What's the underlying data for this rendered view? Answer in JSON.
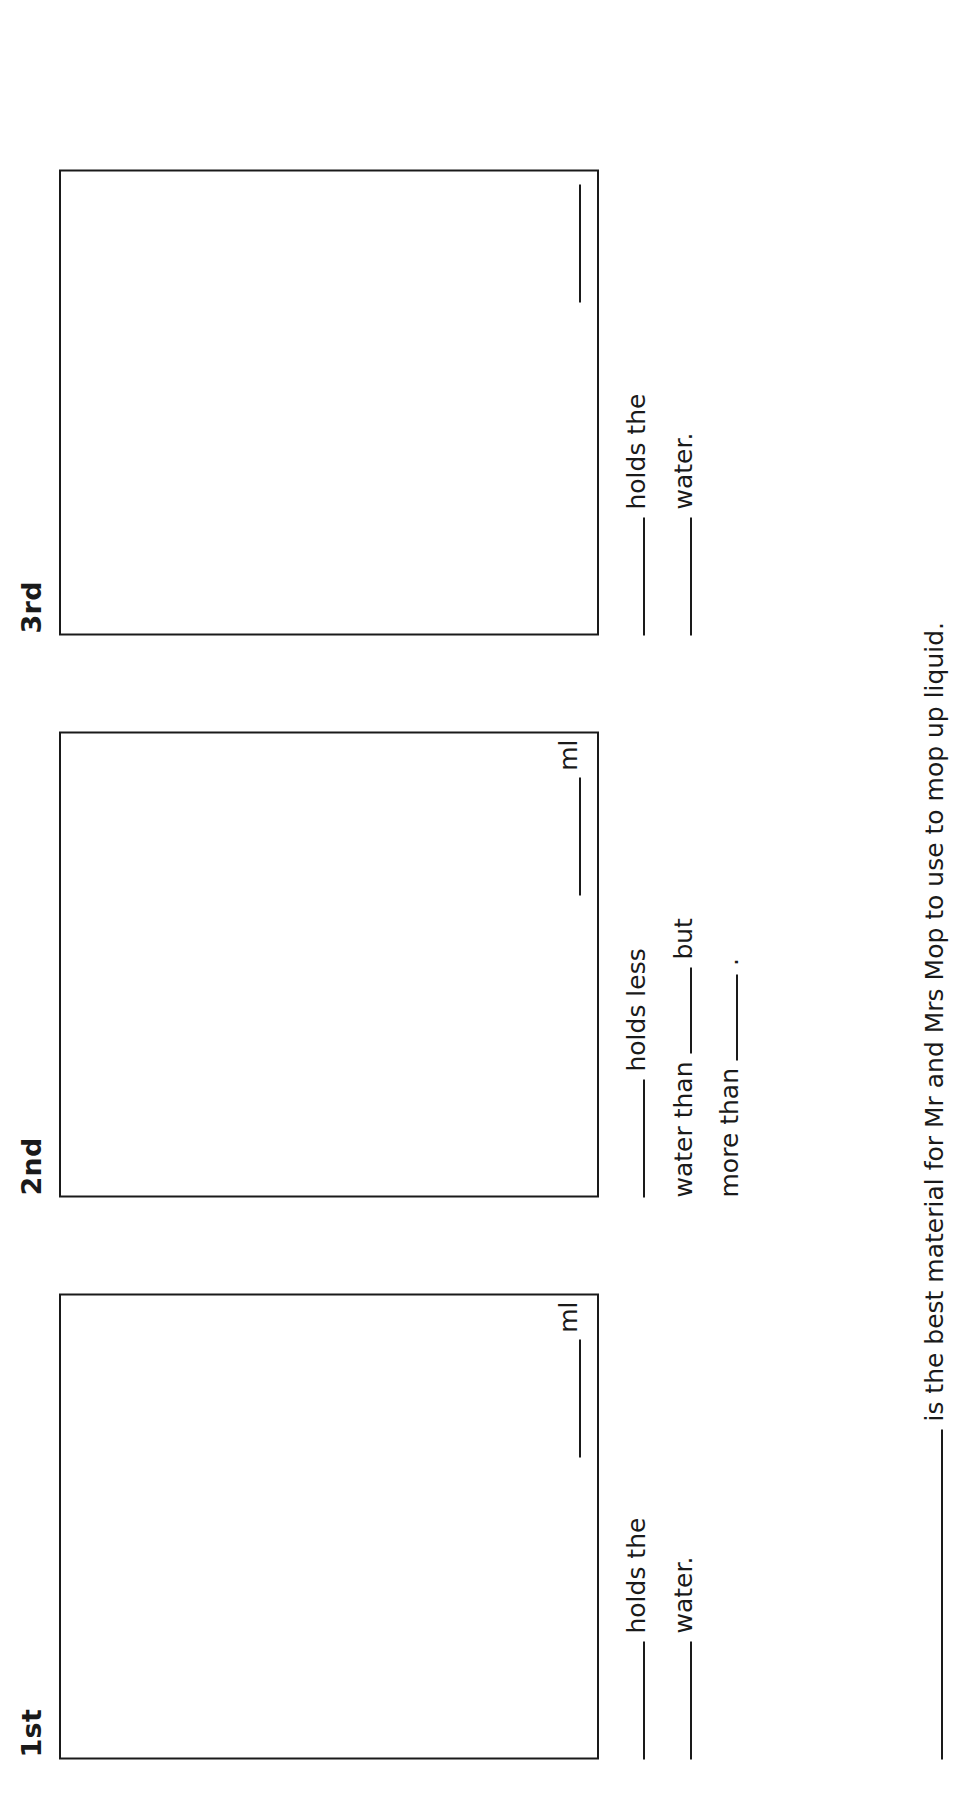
{
  "worksheet": {
    "columns": [
      {
        "ordinal": "1st",
        "measurement_unit": "ml",
        "show_measurement": true,
        "sentences": [
          {
            "segments": [
              "blank",
              " holds the "
            ]
          },
          {
            "segments": [
              "blank",
              " water."
            ]
          }
        ],
        "sentence_text": {
          "line1_after_blank": " holds the ",
          "line2_after_blank": " water."
        }
      },
      {
        "ordinal": "2nd",
        "measurement_unit": "ml",
        "show_measurement": true,
        "sentence_text": {
          "line1_after_blank": " holds less ",
          "line2_prefix": " water than ",
          "line2_after_blank": " but ",
          "line3_prefix": " more than ",
          "line3_after_blank": " ."
        }
      },
      {
        "ordinal": "3rd",
        "measurement_unit": "",
        "show_measurement": false,
        "sentence_text": {
          "line1_after_blank": " holds the ",
          "line2_after_blank": " water."
        }
      }
    ],
    "bottom_sentence": {
      "text_after_blank": " is the best material for Mr and Mrs Mop to use to mop up liquid."
    }
  },
  "colors": {
    "ink": "#1a1a1a",
    "paper": "#ffffff"
  }
}
